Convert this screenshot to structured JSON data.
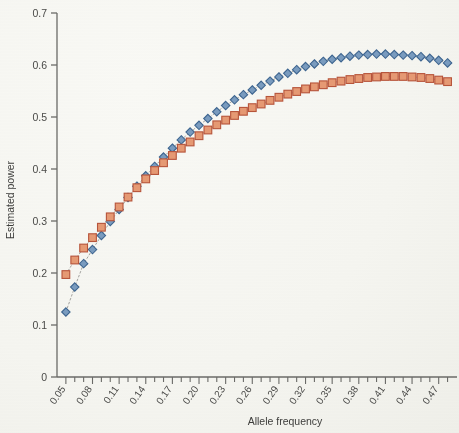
{
  "chart_data": {
    "type": "line",
    "title": "",
    "subtitle": "",
    "xlabel": "Allele frequency",
    "ylabel": "Estimated power",
    "xlim": [
      0.04,
      0.485
    ],
    "ylim": [
      0,
      0.7
    ],
    "grid": false,
    "legend": null,
    "y_ticks": [
      "0",
      "0.1",
      "0.2",
      "0.3",
      "0.4",
      "0.5",
      "0.6",
      "0.7"
    ],
    "y_tick_values": [
      0,
      0.1,
      0.2,
      0.3,
      0.4,
      0.5,
      0.6,
      0.7
    ],
    "x_ticks": [
      "0.05",
      "0.08",
      "0.11",
      "0.14",
      "0.17",
      "0.20",
      "0.23",
      "0.26",
      "0.29",
      "0.32",
      "0.35",
      "0.38",
      "0.41",
      "0.44",
      "0.47"
    ],
    "x_tick_values": [
      0.05,
      0.08,
      0.11,
      0.14,
      0.17,
      0.2,
      0.23,
      0.26,
      0.29,
      0.32,
      0.35,
      0.38,
      0.41,
      0.44,
      0.47
    ],
    "x": [
      0.05,
      0.06,
      0.07,
      0.08,
      0.09,
      0.1,
      0.11,
      0.12,
      0.13,
      0.14,
      0.15,
      0.16,
      0.17,
      0.18,
      0.19,
      0.2,
      0.21,
      0.22,
      0.23,
      0.24,
      0.25,
      0.26,
      0.27,
      0.28,
      0.29,
      0.3,
      0.31,
      0.32,
      0.33,
      0.34,
      0.35,
      0.36,
      0.37,
      0.38,
      0.39,
      0.4,
      0.41,
      0.42,
      0.43,
      0.44,
      0.45,
      0.46,
      0.47,
      0.48
    ],
    "series": [
      {
        "name": "series-diamond",
        "marker": "diamond",
        "color": "#7a9cc0",
        "border_color": "#3d6590",
        "values": [
          0.125,
          0.173,
          0.218,
          0.245,
          0.272,
          0.299,
          0.322,
          0.345,
          0.367,
          0.387,
          0.405,
          0.423,
          0.44,
          0.456,
          0.471,
          0.484,
          0.497,
          0.51,
          0.522,
          0.533,
          0.543,
          0.552,
          0.561,
          0.569,
          0.577,
          0.584,
          0.591,
          0.597,
          0.602,
          0.607,
          0.611,
          0.614,
          0.617,
          0.619,
          0.62,
          0.621,
          0.621,
          0.62,
          0.619,
          0.618,
          0.616,
          0.613,
          0.609,
          0.604
        ]
      },
      {
        "name": "series-square",
        "marker": "square",
        "color": "#e79a74",
        "border_color": "#b8543a",
        "values": [
          0.197,
          0.225,
          0.248,
          0.268,
          0.288,
          0.308,
          0.327,
          0.346,
          0.364,
          0.381,
          0.397,
          0.412,
          0.426,
          0.44,
          0.452,
          0.464,
          0.475,
          0.485,
          0.494,
          0.503,
          0.511,
          0.518,
          0.525,
          0.532,
          0.538,
          0.544,
          0.549,
          0.554,
          0.558,
          0.562,
          0.566,
          0.569,
          0.572,
          0.574,
          0.576,
          0.577,
          0.578,
          0.578,
          0.578,
          0.577,
          0.576,
          0.574,
          0.571,
          0.568
        ]
      }
    ],
    "minor_tick_step": 0.01,
    "axis_color": "#6b6b68"
  }
}
